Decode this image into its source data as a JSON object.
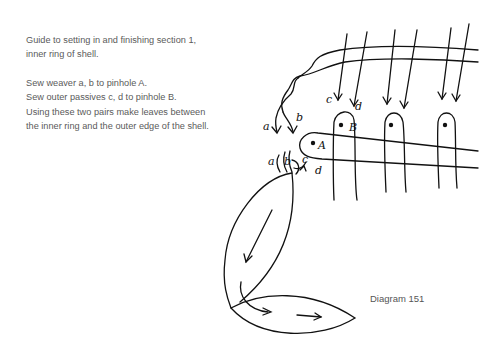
{
  "caption": {
    "title_line1": "Guide to setting in and finishing section 1,",
    "title_line2": "inner ring of shell.",
    "instructions": [
      "Sew weaver a, b to pinhole A.",
      "Sew outer passives c, d to pinhole B.",
      "Using these two pairs make leaves between",
      "the inner ring and the outer edge of the shell."
    ]
  },
  "diagram": {
    "label": "Diagram 151",
    "pinholes": {
      "A": "A",
      "B": "B"
    },
    "thread_labels": {
      "a": "a",
      "b": "b",
      "c": "c",
      "d": "d"
    },
    "lower_labels": {
      "a": "a",
      "b": "b",
      "c": "c",
      "d": "d"
    },
    "stroke_color": "#111111"
  }
}
